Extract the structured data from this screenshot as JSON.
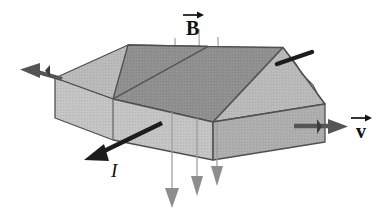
{
  "figure": {
    "background_color": "#ffffff",
    "width": 390,
    "height": 214
  },
  "labels": {
    "magnetic_field": {
      "symbol": "B",
      "name": "magnetic-field-vector-label",
      "has_vector_arrow": true,
      "x": 186,
      "y": 10
    },
    "velocity": {
      "symbol": "v",
      "name": "velocity-vector-label",
      "has_vector_arrow": true,
      "x": 356,
      "y": 113
    },
    "current": {
      "symbol": "I",
      "name": "current-label",
      "has_vector_arrow": false,
      "x": 111,
      "y": 161
    }
  },
  "colors": {
    "outline": "#4a4a4a",
    "top_face_light": "#b9b9b9",
    "top_face_dark": "#8f8f8f",
    "front_face": "#c3c3c3",
    "right_face": "#adadad",
    "field_line": "#9a9a9a",
    "dark_arrow": "#1c1c1c",
    "gray_arrow": "#6f6f6f",
    "text": "#111111"
  },
  "slab": {
    "name": "conductor-slab",
    "description": "Rectangular conducting slab drawn in oblique projection, split into three vertical sections",
    "top_face_outline": [
      [
        55,
        78
      ],
      [
        128,
        45
      ],
      [
        290,
        48
      ],
      [
        325,
        104
      ],
      [
        190,
        131
      ],
      [
        55,
        78
      ]
    ],
    "front_face_outline": [
      [
        55,
        78
      ],
      [
        190,
        131
      ],
      [
        190,
        168
      ],
      [
        55,
        118
      ]
    ],
    "right_face_outline": [
      [
        190,
        131
      ],
      [
        325,
        104
      ],
      [
        325,
        142
      ],
      [
        190,
        168
      ]
    ],
    "divider_lines": [
      {
        "name": "top-divider-left",
        "from": [
          112,
          60
        ],
        "to": [
          213,
          122
        ]
      },
      {
        "name": "top-divider-right",
        "from": [
          208,
          52
        ],
        "to": [
          283,
          112
        ]
      },
      {
        "name": "front-divider",
        "from": [
          112,
          99
        ],
        "to": [
          112,
          140
        ]
      },
      {
        "name": "right-divider",
        "from": [
          213,
          122
        ],
        "to": [
          213,
          160
        ]
      }
    ]
  },
  "field_lines": {
    "name": "magnetic-field-lines",
    "count": 3,
    "direction": "downward through slab",
    "lines": [
      {
        "x_top": 175,
        "y_top": 38,
        "x_bottom": 175,
        "y_bottom": 78,
        "x_exit": 172,
        "y_exit": 135,
        "y_tip": 208
      },
      {
        "x_top": 199,
        "y_top": 30,
        "x_bottom": 199,
        "y_bottom": 72,
        "x_exit": 197,
        "y_exit": 135,
        "y_tip": 197
      },
      {
        "x_top": 218,
        "y_top": 38,
        "x_bottom": 218,
        "y_bottom": 78,
        "x_exit": 216,
        "y_exit": 135,
        "y_tip": 188
      }
    ]
  },
  "arrows": {
    "current_arrow": {
      "name": "current-arrow",
      "color": "#1c1c1c",
      "from": [
        160,
        124
      ],
      "to": [
        86,
        160
      ],
      "label": "I"
    },
    "velocity_arrow": {
      "name": "velocity-arrow",
      "color": "#555555",
      "from": [
        294,
        127
      ],
      "to": [
        344,
        127
      ]
    },
    "left_terminal_arrow": {
      "name": "left-terminal-arrow",
      "color": "#555555",
      "from": [
        62,
        79
      ],
      "to": [
        14,
        68
      ]
    },
    "top_right_rod": {
      "name": "top-right-contact-rod",
      "color": "#1c1c1c",
      "from": [
        283,
        61
      ],
      "to": [
        310,
        52
      ]
    },
    "exit_field_arrows": {
      "name": "field-exit-arrows",
      "color": "#8d8d8d",
      "count": 3
    }
  }
}
